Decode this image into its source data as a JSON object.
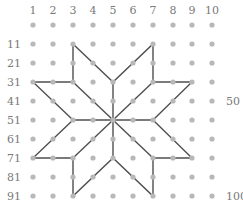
{
  "diagram": {
    "colors": {
      "dot": "#b8b8b8",
      "line": "#4f4f4f",
      "label": "#7a7a7a",
      "background": "#ffffff"
    },
    "grid": {
      "cols": 10,
      "rows": 10,
      "col_x": [
        33,
        53,
        73,
        93,
        113,
        133,
        153,
        173,
        192,
        212
      ],
      "row_y": [
        25,
        44,
        63,
        82,
        101,
        120,
        139,
        158,
        177,
        196
      ]
    },
    "column_labels": [
      "1",
      "2",
      "3",
      "4",
      "5",
      "6",
      "7",
      "8",
      "9",
      "10"
    ],
    "row_labels": [
      "",
      "11",
      "21",
      "31",
      "41",
      "51",
      "61",
      "71",
      "81",
      "91"
    ],
    "right_labels": [
      {
        "text": "50",
        "row": 4
      },
      {
        "text": "100",
        "row": 9
      }
    ],
    "star_outline": [
      [
        3,
        1
      ],
      [
        5,
        3
      ],
      [
        7,
        1
      ],
      [
        7,
        3
      ],
      [
        9,
        3
      ],
      [
        7,
        5
      ],
      [
        9,
        7
      ],
      [
        7,
        7
      ],
      [
        7,
        9
      ],
      [
        5,
        7
      ],
      [
        3,
        9
      ],
      [
        3,
        7
      ],
      [
        1,
        7
      ],
      [
        3,
        5
      ],
      [
        1,
        3
      ],
      [
        3,
        3
      ]
    ],
    "star_center": [
      5,
      5
    ],
    "spokes": [
      [
        5,
        3
      ],
      [
        7,
        3
      ],
      [
        7,
        5
      ],
      [
        7,
        7
      ],
      [
        5,
        7
      ],
      [
        3,
        7
      ],
      [
        3,
        5
      ],
      [
        3,
        3
      ]
    ]
  }
}
